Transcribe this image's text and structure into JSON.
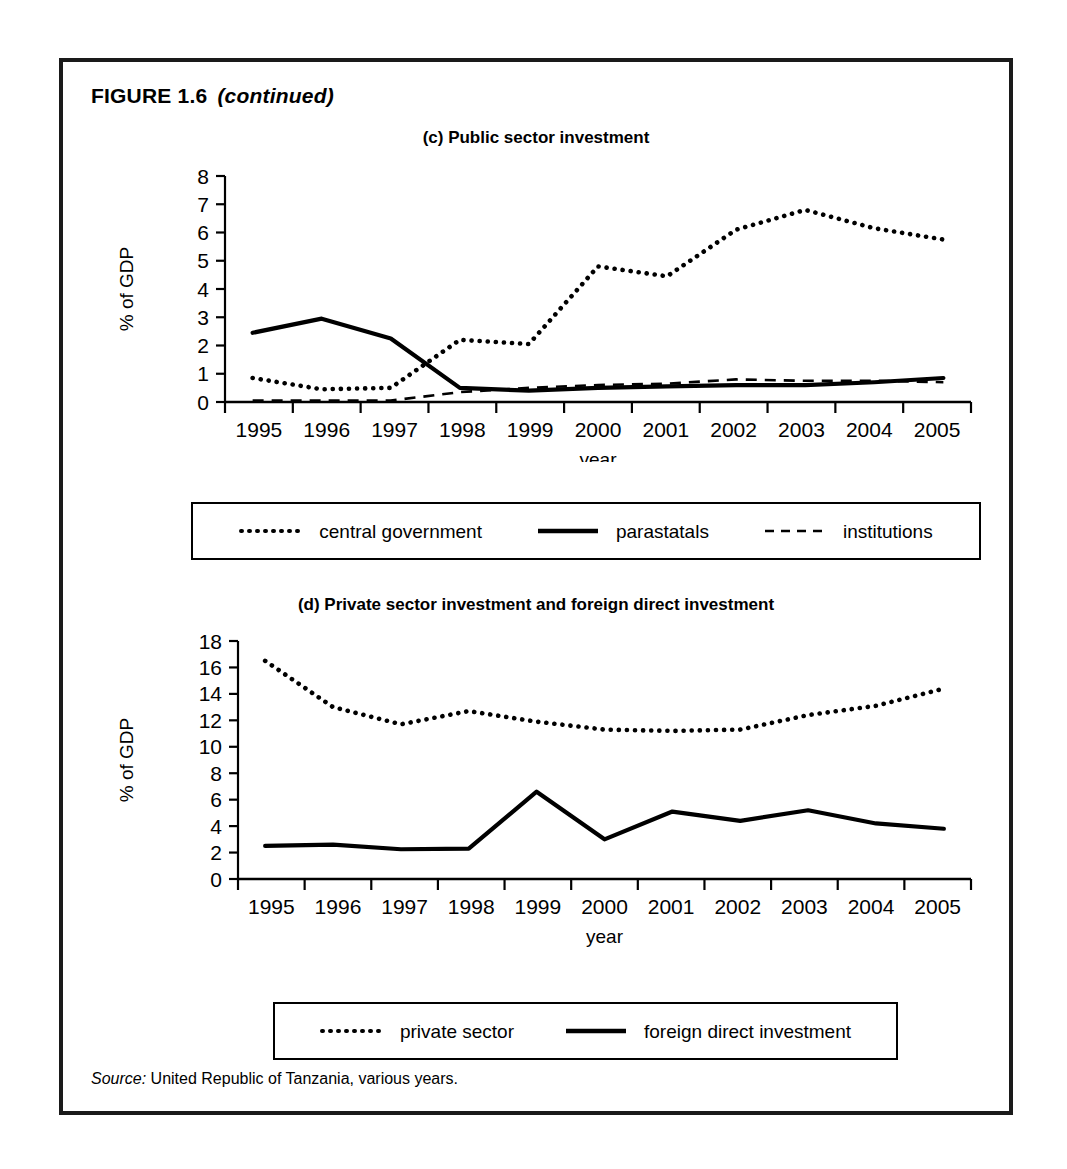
{
  "figure": {
    "title": "FIGURE 1.6",
    "continued": "(continued)",
    "source_word": "Source:",
    "source_text": " United Republic of Tanzania, various years."
  },
  "panel_c": {
    "title": "(c) Public sector investment",
    "ylabel": "% of GDP",
    "xlabel": "year",
    "legend": [
      {
        "label": "central government",
        "style": "dotted"
      },
      {
        "label": "parastatals",
        "style": "solid"
      },
      {
        "label": "institutions",
        "style": "dashed"
      }
    ]
  },
  "panel_d": {
    "title": "(d) Private sector investment and foreign direct investment",
    "ylabel": "% of GDP",
    "xlabel": "year",
    "legend": [
      {
        "label": "private sector",
        "style": "dotted"
      },
      {
        "label": "foreign direct investment",
        "style": "solid"
      }
    ]
  },
  "chart_data": [
    {
      "id": "panel-c",
      "type": "line",
      "title": "(c) Public sector investment",
      "xlabel": "year",
      "ylabel": "% of GDP",
      "x": [
        1995,
        1996,
        1997,
        1998,
        1999,
        2000,
        2001,
        2002,
        2003,
        2004,
        2005
      ],
      "categories": [
        "1995",
        "1996",
        "1997",
        "1998",
        "1999",
        "2000",
        "2001",
        "2002",
        "2003",
        "2004",
        "2005"
      ],
      "xlim": [
        1994.6,
        2005.4
      ],
      "ylim": [
        0,
        8
      ],
      "yticks": [
        0,
        1,
        2,
        3,
        4,
        5,
        6,
        7,
        8
      ],
      "grid": false,
      "legend_position": "below",
      "series": [
        {
          "name": "central government",
          "style": "dotted",
          "color": "#000000",
          "values": [
            0.85,
            0.45,
            0.5,
            2.2,
            2.05,
            4.8,
            4.45,
            6.1,
            6.8,
            6.15,
            5.75
          ]
        },
        {
          "name": "parastatals",
          "style": "solid",
          "color": "#000000",
          "values": [
            2.45,
            2.95,
            2.25,
            0.5,
            0.4,
            0.5,
            0.55,
            0.6,
            0.6,
            0.7,
            0.85
          ]
        },
        {
          "name": "institutions",
          "style": "dashed",
          "color": "#000000",
          "values": [
            0.05,
            0.05,
            0.05,
            0.35,
            0.5,
            0.6,
            0.65,
            0.8,
            0.75,
            0.75,
            0.7
          ]
        }
      ]
    },
    {
      "id": "panel-d",
      "type": "line",
      "title": "(d) Private sector investment and foreign direct investment",
      "xlabel": "year",
      "ylabel": "% of GDP",
      "x": [
        1995,
        1996,
        1997,
        1998,
        1999,
        2000,
        2001,
        2002,
        2003,
        2004,
        2005
      ],
      "categories": [
        "1995",
        "1996",
        "1997",
        "1998",
        "1999",
        "2000",
        "2001",
        "2002",
        "2003",
        "2004",
        "2005"
      ],
      "xlim": [
        1994.6,
        2005.4
      ],
      "ylim": [
        0,
        18
      ],
      "yticks": [
        0,
        2,
        4,
        6,
        8,
        10,
        12,
        14,
        16,
        18
      ],
      "grid": false,
      "legend_position": "below",
      "series": [
        {
          "name": "private sector",
          "style": "dotted",
          "color": "#000000",
          "values": [
            16.5,
            13.0,
            11.7,
            12.7,
            11.9,
            11.3,
            11.2,
            11.3,
            12.4,
            13.1,
            14.4
          ]
        },
        {
          "name": "foreign direct investment",
          "style": "solid",
          "color": "#000000",
          "values": [
            2.5,
            2.6,
            2.25,
            2.3,
            6.6,
            3.0,
            5.1,
            4.4,
            5.2,
            4.2,
            3.8
          ]
        }
      ]
    }
  ],
  "colors": {
    "ink": "#000000",
    "frame": "#1a1a1a",
    "paper": "#ffffff"
  }
}
